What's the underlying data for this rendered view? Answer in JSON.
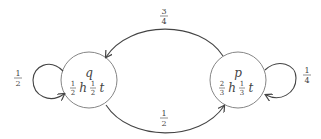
{
  "diagram": {
    "type": "markov-chain",
    "colors": {
      "stroke": "#444444",
      "node_stroke": "#777777",
      "text": "#444444",
      "background": "#ffffff"
    },
    "nodes": [
      {
        "id": "q",
        "label": "q",
        "emission": {
          "h": {
            "num": "1",
            "den": "2"
          },
          "t": {
            "num": "1",
            "den": "2"
          }
        }
      },
      {
        "id": "p",
        "label": "p",
        "emission": {
          "h": {
            "num": "2",
            "den": "3"
          },
          "t": {
            "num": "1",
            "den": "3"
          }
        }
      }
    ],
    "edges": [
      {
        "from": "p",
        "to": "q",
        "prob": {
          "num": "3",
          "den": "4"
        }
      },
      {
        "from": "q",
        "to": "p",
        "prob": {
          "num": "1",
          "den": "2"
        }
      },
      {
        "from": "q",
        "to": "q",
        "prob": {
          "num": "1",
          "den": "2"
        }
      },
      {
        "from": "p",
        "to": "p",
        "prob": {
          "num": "1",
          "den": "4"
        }
      }
    ],
    "symbols": {
      "h": "h",
      "t": "t"
    }
  }
}
